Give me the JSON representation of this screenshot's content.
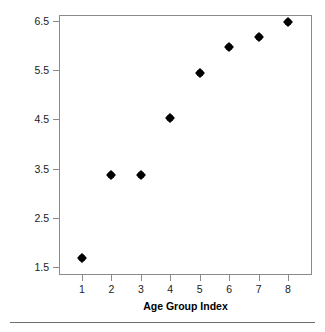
{
  "chart_data": {
    "type": "scatter",
    "title": "",
    "xlabel": "Age Group Index",
    "ylabel": "Log Mortality Rate",
    "x": [
      1,
      2,
      3,
      4,
      5,
      6,
      7,
      8
    ],
    "values": [
      1.68,
      3.37,
      3.38,
      4.52,
      5.44,
      5.98,
      6.18,
      6.48
    ],
    "series": [
      {
        "name": "Log Mortality Rate",
        "values": [
          1.68,
          3.37,
          3.38,
          4.52,
          5.44,
          5.98,
          6.18,
          6.48
        ]
      }
    ],
    "xlim": [
      0.6,
      8.5
    ],
    "ylim": [
      1.15,
      6.75
    ],
    "xticks": [
      1,
      2,
      3,
      4,
      5,
      6,
      7,
      8
    ],
    "xticklabels": [
      "1",
      "2",
      "3",
      "4",
      "5",
      "6",
      "7",
      "8"
    ],
    "yticks": [
      1.5,
      2.5,
      3.5,
      4.5,
      5.5,
      6.5
    ],
    "yticklabels": [
      "1.5",
      "2.5",
      "3.5",
      "4.5",
      "5.5",
      "6.5"
    ],
    "grid": false,
    "legend": false,
    "legend_position": "none",
    "marker": "diamond",
    "marker_color": "#000000",
    "frame_color": "#8a8a8a",
    "background_color": "#ffffff"
  }
}
